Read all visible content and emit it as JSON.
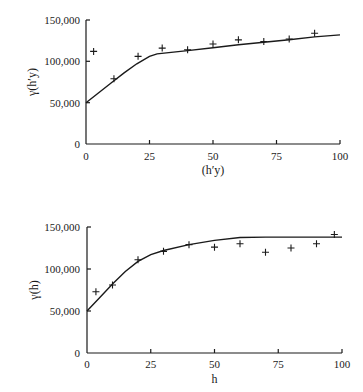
{
  "chart_data": [
    {
      "type": "scatter",
      "title": "",
      "xlabel": "(h′y)",
      "ylabel": "γ(h′y)",
      "xlim": [
        0,
        100
      ],
      "ylim": [
        0,
        150000
      ],
      "x_ticks": [
        "0",
        "25",
        "50",
        "75",
        "100"
      ],
      "y_ticks": [
        "0",
        "50,000",
        "100,000",
        "150,000"
      ],
      "grid": false,
      "series": [
        {
          "name": "experimental",
          "marker": "+",
          "x": [
            3,
            11,
            20.5,
            30,
            40,
            50,
            60,
            70,
            80,
            90
          ],
          "y": [
            112000,
            79000,
            106000,
            116000,
            114000,
            121000,
            126000,
            124000,
            127000,
            134000
          ]
        },
        {
          "name": "model",
          "style": "line",
          "x": [
            0,
            5,
            10,
            15,
            20,
            25,
            28,
            40,
            50,
            60,
            70,
            80,
            90,
            100
          ],
          "y": [
            50000,
            62000,
            74000,
            86000,
            97000,
            106000,
            109000,
            113000,
            116500,
            120000,
            123000,
            126000,
            129500,
            132000
          ]
        }
      ]
    },
    {
      "type": "scatter",
      "title": "",
      "xlabel": "h",
      "ylabel": "γ(h)",
      "xlim": [
        0,
        100
      ],
      "ylim": [
        0,
        150000
      ],
      "x_ticks": [
        "0",
        "25",
        "50",
        "75",
        "100"
      ],
      "y_ticks": [
        "0",
        "50,000",
        "100,000",
        "150,000"
      ],
      "grid": false,
      "series": [
        {
          "name": "experimental",
          "marker": "+",
          "x": [
            3.5,
            10,
            20,
            30,
            40,
            50,
            60,
            70,
            80,
            90,
            97
          ],
          "y": [
            73000,
            81000,
            111000,
            121000,
            129000,
            126000,
            130000,
            120000,
            125000,
            130000,
            141000
          ]
        },
        {
          "name": "model",
          "style": "line",
          "x": [
            0,
            5,
            10,
            15,
            20,
            25,
            30,
            40,
            50,
            60,
            70,
            80,
            90,
            100
          ],
          "y": [
            50000,
            66000,
            82000,
            97000,
            109000,
            117000,
            122000,
            129000,
            134000,
            137500,
            138000,
            138000,
            138000,
            138000
          ]
        }
      ]
    }
  ],
  "charts": [
    {
      "ylabel": "γ(h′y)",
      "xlabel": "(h′y)",
      "x_ticks": [
        "0",
        "25",
        "50",
        "75",
        "100"
      ],
      "y_ticks": [
        "0",
        "50,000",
        "100,000",
        "150,000"
      ]
    },
    {
      "ylabel": "γ(h)",
      "xlabel": "h",
      "x_ticks": [
        "0",
        "25",
        "50",
        "75",
        "100"
      ],
      "y_ticks": [
        "0",
        "50,000",
        "100,000",
        "150,000"
      ]
    }
  ]
}
